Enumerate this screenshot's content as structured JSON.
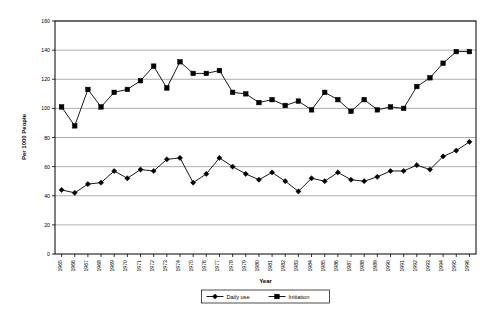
{
  "chart_data": {
    "type": "line",
    "title": "",
    "xlabel": "Year",
    "ylabel": "Per 1000 People",
    "ylim": [
      0,
      160
    ],
    "yticks": [
      0,
      20,
      40,
      60,
      80,
      100,
      120,
      140,
      160
    ],
    "grid": true,
    "legend_position": "bottom",
    "categories": [
      "1965",
      "1966",
      "1967",
      "1968",
      "1969",
      "1970",
      "1971",
      "1972",
      "1973",
      "1974",
      "1975",
      "1976",
      "1977",
      "1978",
      "1979",
      "1980",
      "1981",
      "1982",
      "1983",
      "1984",
      "1985",
      "1986",
      "1987",
      "1988",
      "1989",
      "1990",
      "1991",
      "1992",
      "1993",
      "1994",
      "1995",
      "1996"
    ],
    "series": [
      {
        "name": "Daily use",
        "marker": "diamond",
        "color": "#000000",
        "values": [
          44,
          42,
          48,
          49,
          57,
          52,
          58,
          57,
          65,
          66,
          49,
          55,
          66,
          60,
          55,
          51,
          56,
          50,
          43,
          52,
          50,
          56,
          51,
          50,
          53,
          57,
          57,
          61,
          58,
          67,
          71,
          77
        ]
      },
      {
        "name": "Initiation",
        "marker": "square",
        "color": "#000000",
        "values": [
          101,
          88,
          113,
          101,
          111,
          113,
          119,
          129,
          114,
          132,
          124,
          124,
          126,
          111,
          110,
          104,
          106,
          102,
          105,
          99,
          111,
          106,
          98,
          106,
          99,
          101,
          100,
          115,
          121,
          131,
          139,
          139
        ]
      }
    ]
  },
  "legend": {
    "items": [
      {
        "label": "Daily use",
        "marker": "diamond"
      },
      {
        "label": "Initiation",
        "marker": "square"
      }
    ]
  }
}
